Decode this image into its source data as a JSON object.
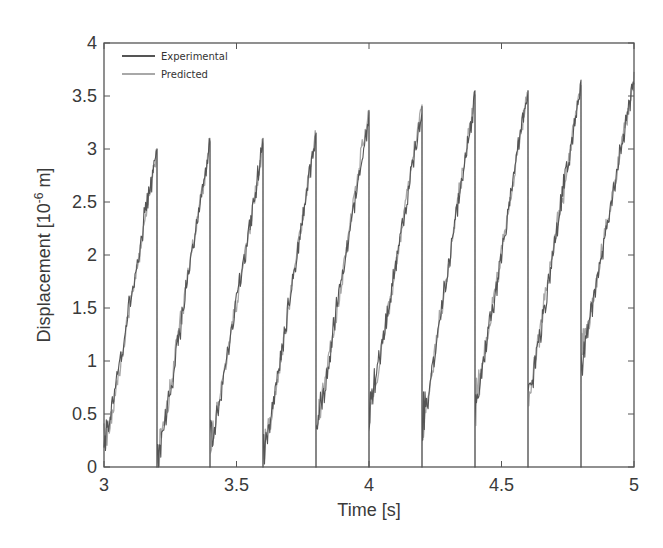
{
  "chart_data": {
    "type": "line",
    "title": "",
    "xlabel": "Time [s]",
    "ylabel": "Displacement [10^-6 m]",
    "ylabel_parts": {
      "main": "Displacement [10",
      "sup": "-6",
      "tail": " m]"
    },
    "xlim": [
      3,
      5
    ],
    "ylim": [
      0,
      4
    ],
    "xticks": [
      3,
      3.5,
      4,
      4.5,
      5
    ],
    "xtick_labels": [
      "3",
      "3.5",
      "4",
      "4.5",
      "5"
    ],
    "yticks": [
      0,
      0.5,
      1,
      1.5,
      2,
      2.5,
      3,
      3.5,
      4
    ],
    "ytick_labels": [
      "0",
      "0.5",
      "1",
      "1.5",
      "2",
      "2.5",
      "3",
      "3.5",
      "4"
    ],
    "grid": false,
    "legend_position": "upper left",
    "cycle_period_s": 0.2,
    "cycles": [
      {
        "t_start": 3.0,
        "t_end": 3.2,
        "start": 0.1,
        "peak": 3.0
      },
      {
        "t_start": 3.2,
        "t_end": 3.4,
        "start": 0.0,
        "peak": 3.05
      },
      {
        "t_start": 3.4,
        "t_end": 3.6,
        "start": 0.1,
        "peak": 3.05
      },
      {
        "t_start": 3.6,
        "t_end": 3.8,
        "start": 0.0,
        "peak": 3.15
      },
      {
        "t_start": 3.8,
        "t_end": 4.0,
        "start": 0.3,
        "peak": 3.35
      },
      {
        "t_start": 4.0,
        "t_end": 4.2,
        "start": 0.4,
        "peak": 3.4
      },
      {
        "t_start": 4.2,
        "t_end": 4.4,
        "start": 0.3,
        "peak": 3.5
      },
      {
        "t_start": 4.4,
        "t_end": 4.6,
        "start": 0.5,
        "peak": 3.55
      },
      {
        "t_start": 4.6,
        "t_end": 4.8,
        "start": 0.6,
        "peak": 3.6
      },
      {
        "t_start": 4.8,
        "t_end": 5.0,
        "start": 0.9,
        "peak": 3.7
      }
    ],
    "series": [
      {
        "name": "Experimental",
        "color": "#555555",
        "noise": 0.12,
        "seed": 7
      },
      {
        "name": "Predicted",
        "color": "#a8a8a8",
        "noise": 0.1,
        "seed": 19
      }
    ]
  }
}
